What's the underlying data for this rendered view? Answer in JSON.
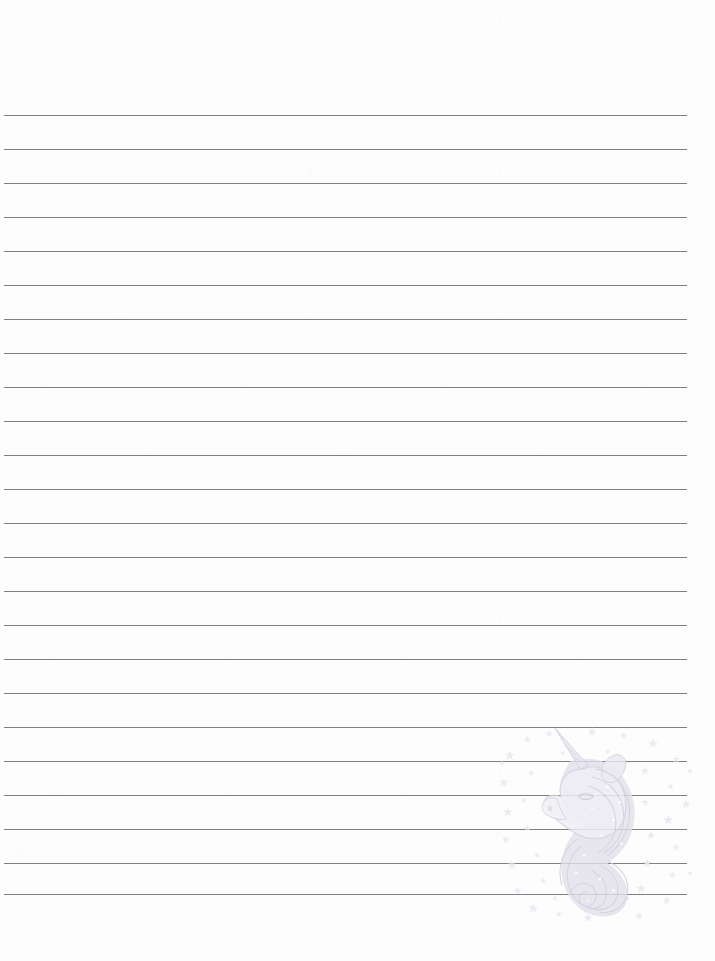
{
  "page": {
    "kind": "lined-notebook-paper",
    "width": 715,
    "height": 961,
    "background_color": "#fdfdfd",
    "paper_label": "",
    "top_margin_text": ""
  },
  "ruling": {
    "line_count": 24,
    "first_line_y": 115,
    "line_spacing": 34,
    "line_left_x": 4,
    "line_right_x": 687,
    "line_color": "#6e7276",
    "line_thickness": 1,
    "lines_y": [
      115,
      149,
      183,
      217,
      251,
      285,
      319,
      353,
      387,
      421,
      455,
      489,
      523,
      557,
      591,
      625,
      659,
      693,
      727,
      761,
      795,
      829,
      863,
      894
    ]
  },
  "watermark": {
    "name": "unicorn-head-with-stars",
    "description": "Faint pastel unicorn head in profile facing left with long flowing curled mane, spiral horn, and scattered stars",
    "x": 498,
    "y": 726,
    "width": 196,
    "height": 196,
    "body_color": "#e3e1ea",
    "outline_color": "#c9c7d4",
    "star_color": "#ece7f1",
    "opacity": 0.85
  }
}
